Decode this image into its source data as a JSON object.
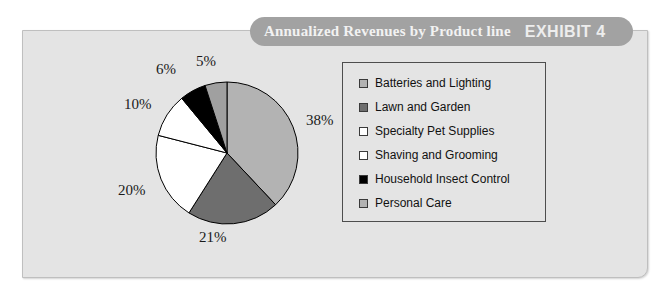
{
  "banner": {
    "title": "Annualized Revenues by Product line",
    "exhibit": "EXHIBIT 4"
  },
  "chart_data": {
    "type": "pie",
    "title": "Annualized Revenues by Product line",
    "legend_position": "right",
    "start_angle_deg": 0,
    "direction": "clockwise",
    "categories": [
      "Batteries and Lighting",
      "Lawn and Garden",
      "Specialty Pet Supplies",
      "Shaving and Grooming",
      "Household Insect Control",
      "Personal Care"
    ],
    "values": [
      38,
      21,
      20,
      10,
      6,
      5
    ],
    "value_unit": "%",
    "data_labels": [
      "38%",
      "21%",
      "20%",
      "10%",
      "6%",
      "5%"
    ],
    "colors": [
      "#b3b3b3",
      "#6e6e6e",
      "#ffffff",
      "#ffffff",
      "#000000",
      "#a0a0a0"
    ],
    "slice_border_color": "#000000",
    "background": "#e4e4e4"
  },
  "labels": {
    "p38": "38%",
    "p21": "21%",
    "p20": "20%",
    "p10": "10%",
    "p6": "6%",
    "p5": "5%"
  },
  "legend": {
    "items": [
      {
        "label": "Batteries and Lighting",
        "color": "#b3b3b3"
      },
      {
        "label": "Lawn and Garden",
        "color": "#6e6e6e"
      },
      {
        "label": "Specialty Pet Supplies",
        "color": "#ffffff"
      },
      {
        "label": "Shaving and Grooming",
        "color": "#ffffff"
      },
      {
        "label": "Household Insect Control",
        "color": "#000000"
      },
      {
        "label": "Personal Care",
        "color": "#b3b3b3"
      }
    ]
  }
}
